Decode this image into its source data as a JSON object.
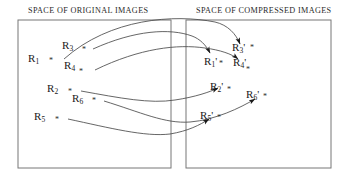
{
  "figure": {
    "type": "diagram",
    "headers": {
      "left": "SPACE OF ORIGINAL IMAGES",
      "right": "SPACE OF COMPRESSED IMAGES"
    },
    "boxes": [
      {
        "name": "left-box",
        "x": 18,
        "y": 20,
        "w": 153,
        "h": 148
      },
      {
        "name": "right-box",
        "x": 186,
        "y": 20,
        "w": 145,
        "h": 148
      }
    ],
    "stroke_color": "#555555",
    "text_color": "#1a1a1a",
    "background": "#ffffff",
    "source_points": [
      {
        "id": "R1",
        "label": "R",
        "subscript": "1",
        "marker": "*",
        "x": 55,
        "y": 59
      },
      {
        "id": "R3",
        "label": "R",
        "subscript": "3",
        "marker": "*",
        "x": 78,
        "y": 46
      },
      {
        "id": "R4",
        "label": "R",
        "subscript": "4",
        "marker": "*",
        "x": 80,
        "y": 66
      },
      {
        "id": "R2",
        "label": "R",
        "subscript": "2",
        "marker": "*",
        "x": 66,
        "y": 89
      },
      {
        "id": "R6",
        "label": "R",
        "subscript": "6",
        "marker": "*",
        "x": 89,
        "y": 99
      },
      {
        "id": "R5",
        "label": "R",
        "subscript": "5",
        "marker": "*",
        "x": 53,
        "y": 117
      }
    ],
    "target_points": [
      {
        "id": "R1p",
        "label": "R",
        "subscript": "1",
        "prime": "'",
        "marker": "*",
        "x": 213,
        "y": 62
      },
      {
        "id": "R3p",
        "label": "R",
        "subscript": "3",
        "prime": "'",
        "marker": "*",
        "x": 244,
        "y": 48
      },
      {
        "id": "R4p",
        "label": "R",
        "subscript": "4",
        "prime": "'",
        "marker": "*",
        "x": 243,
        "y": 64
      },
      {
        "id": "R2p",
        "label": "R",
        "subscript": "2",
        "prime": "'",
        "marker": "*",
        "x": 225,
        "y": 88
      },
      {
        "id": "R6p",
        "label": "R",
        "subscript": "6",
        "prime": "'",
        "marker": "*",
        "x": 261,
        "y": 96
      },
      {
        "id": "R5p",
        "label": "R",
        "subscript": "5",
        "prime": "'",
        "marker": "*",
        "x": 215,
        "y": 117
      }
    ],
    "mappings": [
      {
        "from": "R1",
        "to": "R3p"
      },
      {
        "from": "R3",
        "to": "R1p"
      },
      {
        "from": "R4",
        "to": "R4p"
      },
      {
        "from": "R2",
        "to": "R2p"
      },
      {
        "from": "R6",
        "to": "R6p"
      },
      {
        "from": "R5",
        "to": "R5p"
      }
    ]
  }
}
